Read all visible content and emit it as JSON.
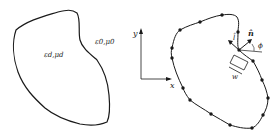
{
  "left_panel": {
    "inner_label": "ε_d,μ_d",
    "inner_label_main": "ε",
    "inner_label_text": "εd,μd",
    "outer_label_text": "ε0,μ0"
  },
  "right_panel": {
    "axis_x_label": "x",
    "axis_y_label": "y",
    "normal_label": "n̂",
    "tangent_label": "l̂",
    "angle_label": "ϕ",
    "width_label": "w"
  },
  "colors": {
    "stroke": "#1a1a1a",
    "background": "#ffffff"
  }
}
